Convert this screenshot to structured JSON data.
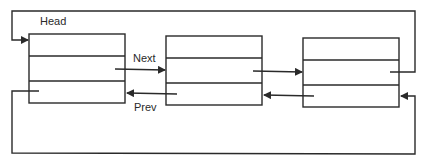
{
  "diagram": {
    "type": "circular doubly linked list",
    "labels": {
      "head": "Head",
      "next": "Next",
      "prev": "Prev"
    },
    "nodes": [
      {
        "id": "node-1",
        "fields": 3
      },
      {
        "id": "node-2",
        "fields": 3
      },
      {
        "id": "node-3",
        "fields": 3
      }
    ],
    "edges": [
      {
        "from": "node-1",
        "to": "node-2",
        "label": "Next"
      },
      {
        "from": "node-2",
        "to": "node-1",
        "label": "Prev"
      },
      {
        "from": "node-2",
        "to": "node-3",
        "label": ""
      },
      {
        "from": "node-3",
        "to": "node-2",
        "label": ""
      },
      {
        "from": "node-3",
        "to": "node-1",
        "label": "",
        "route": "top-loop"
      },
      {
        "from": "node-1",
        "to": "node-3",
        "label": "",
        "route": "bottom-loop"
      }
    ],
    "colors": {
      "line": "#2a2a2a",
      "background": "#ffffff"
    }
  }
}
